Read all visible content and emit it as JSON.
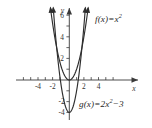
{
  "figure": {
    "background_color": "#ffffff",
    "stroke_color": "#2e2e2e",
    "axis_color": "#3a3a3a"
  },
  "chart_data": {
    "type": "line",
    "title": "",
    "xlabel": "x",
    "ylabel": "y",
    "xlim": [
      -5.5,
      6.5
    ],
    "ylim": [
      -4.6,
      7.4
    ],
    "grid": false,
    "legend": "inline-annotations",
    "x_ticks": [
      -4,
      -2,
      2,
      4
    ],
    "y_ticks": [
      -4,
      -2,
      2,
      4,
      6
    ],
    "x_tick_labels": [
      "-4",
      "-2",
      "2",
      "4"
    ],
    "y_tick_labels": [
      "-4",
      "-2",
      "2",
      "4",
      "6"
    ],
    "series": [
      {
        "name": "f(x) = x^2",
        "equation": "f(x) = x²",
        "type": "parabola",
        "a": 1,
        "b": 0,
        "c": 0,
        "vertex": [
          0,
          0
        ],
        "x": [
          -2.7,
          -2.4,
          -2.1,
          -1.8,
          -1.5,
          -1.2,
          -0.9,
          -0.6,
          -0.3,
          0,
          0.3,
          0.6,
          0.9,
          1.2,
          1.5,
          1.8,
          2.1,
          2.4,
          2.7
        ],
        "values": [
          7.29,
          5.76,
          4.41,
          3.24,
          2.25,
          1.44,
          0.81,
          0.36,
          0.09,
          0,
          0.09,
          0.36,
          0.81,
          1.44,
          2.25,
          3.24,
          4.41,
          5.76,
          7.29
        ],
        "arrow_ends": true
      },
      {
        "name": "g(x) = 2x^2 - 3",
        "equation": "g(x) = 2x² − 3",
        "type": "parabola",
        "a": 2,
        "b": 0,
        "c": -3,
        "vertex": [
          0,
          -3
        ],
        "x": [
          -2.28,
          -2.05,
          -1.82,
          -1.6,
          -1.37,
          -1.14,
          -0.91,
          -0.68,
          -0.46,
          -0.23,
          0,
          0.23,
          0.46,
          0.68,
          0.91,
          1.14,
          1.37,
          1.6,
          1.82,
          2.05,
          2.28
        ],
        "values": [
          7.4,
          5.4,
          3.63,
          2.12,
          0.75,
          -0.4,
          -1.34,
          -2.08,
          -2.58,
          -2.89,
          -3,
          -2.89,
          -2.58,
          -2.08,
          -1.34,
          -0.4,
          0.75,
          2.12,
          3.63,
          5.4,
          7.4
        ],
        "arrow_ends": true
      }
    ]
  },
  "annotations": {
    "f_label": {
      "name": "f",
      "arg": "(x)",
      "equals": "=",
      "term": "x",
      "exponent": "2"
    },
    "g_label": {
      "name": "g",
      "arg": "(x)",
      "equals": "=",
      "coefficient": "2x",
      "exponent": "2",
      "minus": "−",
      "constant": "3"
    }
  },
  "axes": {
    "x_axis_name": "x",
    "y_axis_name": "y",
    "x_labels": [
      {
        "text": "-4",
        "x": -4
      },
      {
        "text": "-2",
        "x": -2
      },
      {
        "text": "2",
        "x": 2
      },
      {
        "text": "4",
        "x": 4
      }
    ],
    "y_labels": [
      {
        "text": "6",
        "y": 6
      },
      {
        "text": "4",
        "y": 4
      },
      {
        "text": "2",
        "y": 2
      },
      {
        "text": "-2",
        "y": -2
      },
      {
        "text": "-4",
        "y": -4
      }
    ]
  }
}
